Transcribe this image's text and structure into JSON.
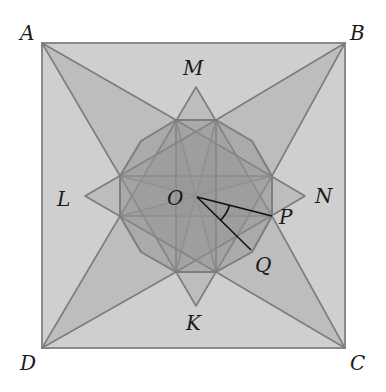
{
  "diagram": {
    "type": "geometry",
    "colors": {
      "square_fill": "#cfcfcf",
      "square_stroke": "#8a8a8a",
      "shape_fill": "#9a9a9a",
      "shape_stroke": "#7d7d7d",
      "angle_lines": "#111111",
      "label": "#1a1a1a"
    },
    "labels": {
      "A": "A",
      "B": "B",
      "C": "C",
      "D": "D",
      "M": "M",
      "N": "N",
      "K": "K",
      "L": "L",
      "O": "O",
      "P": "P",
      "Q": "Q"
    },
    "points": {
      "A": [
        42,
        43
      ],
      "B": [
        345,
        43
      ],
      "C": [
        345,
        348
      ],
      "D": [
        42,
        348
      ],
      "O": [
        197,
        197
      ],
      "P": [
        272,
        216
      ],
      "Q": [
        252,
        252
      ],
      "M": [
        196,
        87
      ],
      "N": [
        305,
        196
      ],
      "K": [
        196,
        306
      ],
      "L": [
        85,
        196
      ]
    }
  }
}
